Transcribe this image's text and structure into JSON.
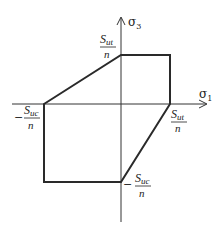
{
  "diagram": {
    "title": "",
    "axes": {
      "horizontal": {
        "symbol": "σ",
        "subscript": "1"
      },
      "vertical": {
        "symbol": "σ",
        "subscript": "3"
      }
    },
    "labels": {
      "top": {
        "numerator_main": "S",
        "numerator_sub": "ut",
        "denominator": "n",
        "sign": ""
      },
      "right": {
        "numerator_main": "S",
        "numerator_sub": "ut",
        "denominator": "n",
        "sign": ""
      },
      "left": {
        "numerator_main": "S",
        "numerator_sub": "uc",
        "denominator": "n",
        "sign": "−"
      },
      "bottom": {
        "numerator_main": "S",
        "numerator_sub": "uc",
        "denominator": "n",
        "sign": "−"
      }
    },
    "colors": {
      "line": "#2a2a2a",
      "axis": "#333333"
    }
  }
}
